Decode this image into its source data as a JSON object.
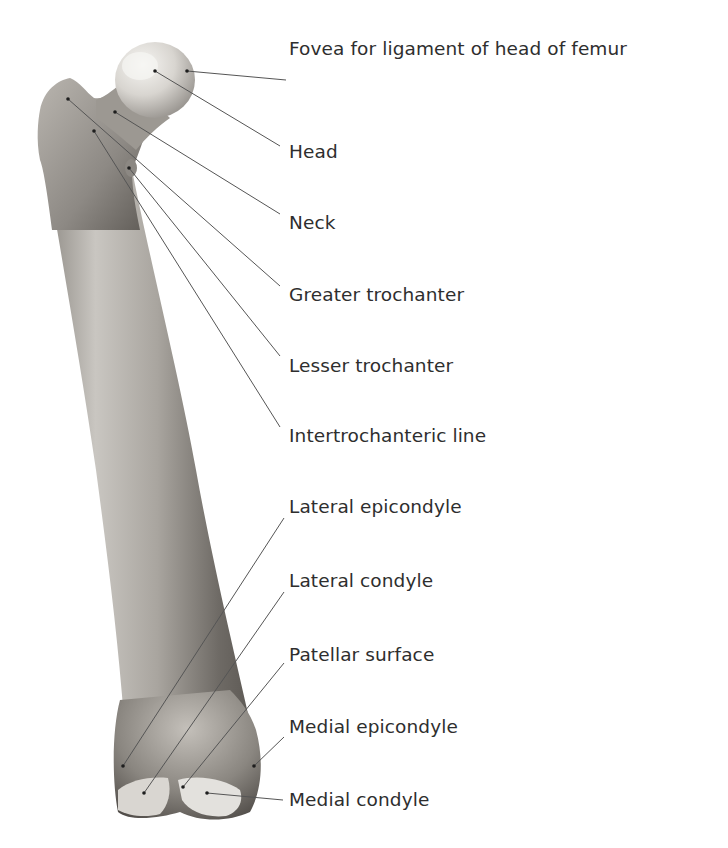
{
  "diagram": {
    "colors": {
      "background": "#ffffff",
      "bone_light": "#e8e6e2",
      "bone_mid": "#b7b3ad",
      "bone_dark": "#6f6b66",
      "leader_line": "#555555",
      "label_text": "#2e2e2e"
    },
    "labels": [
      {
        "id": "fovea",
        "text": "Fovea for ligament of head of femur",
        "x": 289,
        "y": 38,
        "anchor": [
          187,
          71
        ],
        "elbow": [
          286,
          80
        ]
      },
      {
        "id": "head",
        "text": "Head",
        "x": 289,
        "y": 141,
        "anchor": [
          155,
          71
        ],
        "elbow": [
          280,
          146
        ]
      },
      {
        "id": "neck",
        "text": "Neck",
        "x": 289,
        "y": 212,
        "anchor": [
          115,
          112
        ],
        "elbow": [
          280,
          214
        ]
      },
      {
        "id": "greater-trochanter",
        "text": "Greater trochanter",
        "x": 289,
        "y": 284,
        "anchor": [
          68,
          99
        ],
        "elbow": [
          280,
          286
        ]
      },
      {
        "id": "lesser-trochanter",
        "text": "Lesser trochanter",
        "x": 289,
        "y": 355,
        "anchor": [
          129,
          168
        ],
        "elbow": [
          280,
          356
        ]
      },
      {
        "id": "intertrochanteric-line",
        "text": "Intertrochanteric line",
        "x": 289,
        "y": 425,
        "anchor": [
          94,
          131
        ],
        "elbow": [
          280,
          427
        ]
      },
      {
        "id": "lateral-epicondyle",
        "text": "Lateral epicondyle",
        "x": 289,
        "y": 496,
        "anchor": [
          123,
          766
        ],
        "elbow": [
          284,
          518
        ]
      },
      {
        "id": "lateral-condyle",
        "text": "Lateral condyle",
        "x": 289,
        "y": 570,
        "anchor": [
          144,
          793
        ],
        "elbow": [
          284,
          592
        ]
      },
      {
        "id": "patellar-surface",
        "text": "Patellar surface",
        "x": 289,
        "y": 644,
        "anchor": [
          183,
          787
        ],
        "elbow": [
          284,
          663
        ]
      },
      {
        "id": "medial-epicondyle",
        "text": "Medial epicondyle",
        "x": 289,
        "y": 716,
        "anchor": [
          254,
          766
        ],
        "elbow": [
          284,
          737
        ]
      },
      {
        "id": "medial-condyle",
        "text": "Medial condyle",
        "x": 289,
        "y": 789,
        "anchor": [
          207,
          793
        ],
        "elbow": [
          283,
          800
        ]
      }
    ]
  }
}
